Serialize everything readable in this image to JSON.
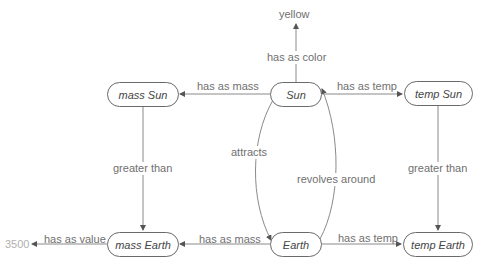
{
  "diagram": {
    "nodes": {
      "mass_sun": "mass Sun",
      "sun": "Sun",
      "temp_sun": "temp Sun",
      "mass_earth": "mass Earth",
      "earth": "Earth",
      "temp_earth": "temp Earth"
    },
    "literals": {
      "yellow": "yellow",
      "value_3500": "3500"
    },
    "edges": {
      "sun_color": "has as color",
      "sun_mass": "has as mass",
      "sun_temp": "has as temp",
      "mass_greater": "greater than",
      "temp_greater": "greater than",
      "attracts": "attracts",
      "revolves": "revolves around",
      "earth_mass": "has as mass",
      "earth_temp": "has as temp",
      "mass_value": "has as value"
    },
    "colors": {
      "edge": "#7a7a7a",
      "node_border": "#6a6a6a",
      "label": "#707070",
      "literal": "#707070",
      "literal_faded": "#b0b0b0"
    }
  }
}
